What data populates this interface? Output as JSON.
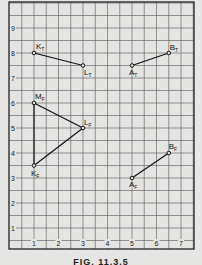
{
  "figure": {
    "caption": "FIG. 11.3.5",
    "x_ticks": [
      "1",
      "2",
      "3",
      "4",
      "5",
      "6",
      "7"
    ],
    "y_ticks": [
      "1",
      "2",
      "3",
      "4",
      "5",
      "6",
      "7",
      "8",
      "9"
    ]
  },
  "chart_data": {
    "type": "scatter",
    "title": "",
    "xlabel": "",
    "ylabel": "",
    "xlim": [
      0,
      7.5
    ],
    "ylim": [
      0,
      10
    ],
    "grid": true,
    "grid_minor_step": 0.5,
    "x_tick_labels": [
      "1",
      "2",
      "3",
      "4",
      "5",
      "6",
      "7"
    ],
    "y_tick_labels": [
      "1",
      "2",
      "3",
      "4",
      "5",
      "6",
      "7",
      "8",
      "9"
    ],
    "points": [
      {
        "label": "K",
        "sub": "T",
        "x": 1,
        "y": 8
      },
      {
        "label": "L",
        "sub": "T",
        "x": 3,
        "y": 7.5
      },
      {
        "label": "A",
        "sub": "T",
        "x": 5,
        "y": 7.5
      },
      {
        "label": "B",
        "sub": "T",
        "x": 6.5,
        "y": 8
      },
      {
        "label": "M",
        "sub": "F",
        "x": 1,
        "y": 6
      },
      {
        "label": "L",
        "sub": "F",
        "x": 3,
        "y": 5
      },
      {
        "label": "K",
        "sub": "F",
        "x": 1,
        "y": 3.5
      },
      {
        "label": "A",
        "sub": "F",
        "x": 5,
        "y": 3
      },
      {
        "label": "B",
        "sub": "F",
        "x": 6.5,
        "y": 4
      }
    ],
    "segments": [
      {
        "from": "K_T",
        "to": "L_T"
      },
      {
        "from": "A_T",
        "to": "B_T"
      },
      {
        "from": "M_F",
        "to": "L_F"
      },
      {
        "from": "L_F",
        "to": "K_F"
      },
      {
        "from": "K_F",
        "to": "M_F"
      },
      {
        "from": "A_F",
        "to": "B_F"
      }
    ]
  }
}
